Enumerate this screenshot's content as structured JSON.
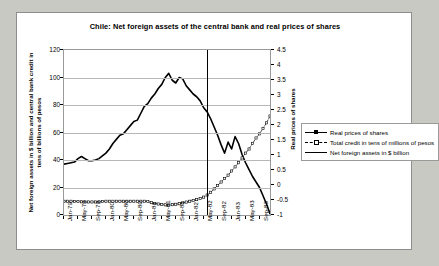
{
  "chart_data": {
    "type": "line",
    "title": "Chile: Net foreign assets of the central bank and real prices of shares",
    "xlabel": "",
    "ylabel": "Net foreign assets in $ billion and central bank credit in tens of billions of pesos",
    "y2label": "Real prices of shares",
    "ylim": [
      0,
      120
    ],
    "y2lim": [
      -1,
      4.5
    ],
    "yticks": [
      0,
      20,
      40,
      60,
      80,
      100,
      120
    ],
    "y2ticks": [
      -1,
      -0.5,
      0,
      0.5,
      1,
      1.5,
      2,
      2.5,
      3,
      3.5,
      4,
      4.5
    ],
    "grid": true,
    "legend_position": "right",
    "annotations": [
      {
        "name": "devaluation-vertical-line",
        "x": "Jun-82",
        "type": "vline"
      }
    ],
    "xticklabels": [
      "Jan-79",
      "May-79",
      "Sep-79",
      "Jan-80",
      "May-80",
      "Sep-80",
      "Jan-81",
      "May-81",
      "Sep-81",
      "Jan-82",
      "May-82",
      "Sep-82",
      "Jan-83",
      "May-83",
      "Sep-83"
    ],
    "x": [
      "Jan-79",
      "Feb-79",
      "Mar-79",
      "Apr-79",
      "May-79",
      "Jun-79",
      "Jul-79",
      "Aug-79",
      "Sep-79",
      "Oct-79",
      "Nov-79",
      "Dec-79",
      "Jan-80",
      "Feb-80",
      "Mar-80",
      "Apr-80",
      "May-80",
      "Jun-80",
      "Jul-80",
      "Aug-80",
      "Sep-80",
      "Oct-80",
      "Nov-80",
      "Dec-80",
      "Jan-81",
      "Feb-81",
      "Mar-81",
      "Apr-81",
      "May-81",
      "Jun-81",
      "Jul-81",
      "Aug-81",
      "Sep-81",
      "Oct-81",
      "Nov-81",
      "Dec-81",
      "Jan-82",
      "Feb-82",
      "Mar-82",
      "Apr-82",
      "May-82",
      "Jun-82",
      "Jul-82",
      "Aug-82",
      "Sep-82",
      "Oct-82",
      "Nov-82",
      "Dec-82",
      "Jan-83",
      "Feb-83",
      "Mar-83",
      "Apr-83",
      "May-83",
      "Jun-83",
      "Jul-83",
      "Aug-83",
      "Sep-83",
      "Oct-83",
      "Nov-83",
      "Dec-83"
    ],
    "series": [
      {
        "name": "Net foreign assets in $ billion",
        "axis": "left",
        "style": "solid-thick",
        "values": [
          37,
          37.5,
          38,
          38.5,
          41,
          42.5,
          41,
          39.5,
          39.5,
          40,
          41,
          43,
          45,
          48,
          52,
          55,
          58,
          59,
          62,
          65,
          68,
          69,
          74,
          79,
          81,
          85,
          88,
          92,
          95,
          100,
          103,
          98,
          96,
          100,
          99,
          94,
          91,
          88,
          86,
          83,
          78,
          75,
          70,
          64,
          58,
          51,
          45,
          53,
          48,
          57,
          52,
          44,
          38,
          33,
          28,
          24,
          20,
          14,
          8,
          1
        ]
      },
      {
        "name": "Total credit in tens of millions of pesos",
        "axis": "left",
        "style": "dashed-open-square",
        "values": [
          10,
          10,
          10,
          9.8,
          9.8,
          9.6,
          9.5,
          9.5,
          9.5,
          9.5,
          9.6,
          9.8,
          10,
          10,
          10,
          10,
          10,
          10,
          10,
          10,
          10,
          10,
          10,
          10,
          9.8,
          9,
          8.4,
          8,
          7.6,
          7.4,
          7.3,
          7.5,
          7.8,
          8.2,
          8.8,
          9.4,
          10,
          10.6,
          11.2,
          12,
          13,
          14.5,
          16.5,
          19,
          21.5,
          24,
          26.5,
          29,
          32,
          35,
          38,
          41.5,
          45,
          48,
          52,
          56,
          59,
          63,
          67,
          72
        ]
      },
      {
        "name": "Real prices of shares",
        "axis": "right",
        "style": "solid-filled-square",
        "values": [
          12.5,
          12.8,
          13,
          12.6,
          13,
          13.2,
          13,
          12.8,
          13,
          13.2,
          13.5,
          13.8,
          14,
          14.2,
          14.5,
          15,
          15.5,
          16,
          17,
          18,
          19.5,
          21.5,
          24,
          26,
          28,
          26.5,
          27,
          25.5,
          24,
          23,
          22,
          21,
          20,
          19.5,
          18.5,
          17.5,
          17,
          16.5,
          16,
          15.5,
          15,
          14.5,
          15.5,
          16,
          16.2,
          15.5,
          14.5,
          14,
          13.5,
          13,
          12.6,
          12.3,
          12,
          11.8,
          12,
          12.2,
          12.3,
          12.4,
          12.5,
          12.5
        ]
      }
    ]
  },
  "legend": {
    "items": [
      {
        "label": "Real prices of shares",
        "key": "solid-filled-square"
      },
      {
        "label": "Total credit in tens of millions of pesos",
        "key": "dashed-open-square"
      },
      {
        "label": "Net foreign assets in $ billion",
        "key": "solid-thick"
      }
    ]
  }
}
